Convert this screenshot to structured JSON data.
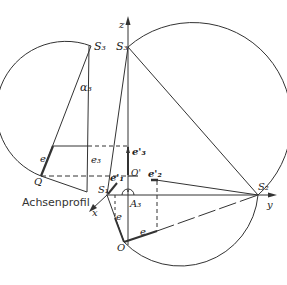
{
  "figure": {
    "caption_label": "Achsenprofil",
    "colors": {
      "stroke": "#333333",
      "thin": "#555555",
      "background": "#ffffff"
    }
  },
  "labels": {
    "S3_left": "S₃",
    "S3_right": "S₃",
    "alpha3": "α₃",
    "z_axis": "z",
    "y_axis": "y",
    "x_axis": "x",
    "S1": "S₁",
    "S2": "S₂",
    "O": "O",
    "O_prime": "O'",
    "A3": "A₃",
    "Q": "Q",
    "e_left": "e",
    "e3_left": "e₃",
    "e3_prime": "e'₃",
    "e1_prime": "e'₁",
    "e2_prime": "e'₂",
    "e_lower": "e",
    "e_bottom": "e"
  }
}
